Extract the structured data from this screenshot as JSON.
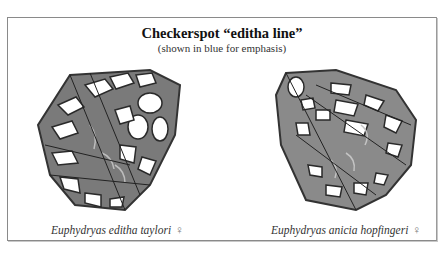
{
  "figure": {
    "title": "Checkerspot “editha line”",
    "subtitle": "(shown in blue for emphasis)",
    "specimens": [
      {
        "name": "Euphydryas editha taylori",
        "sex_symbol": "♀",
        "image": "left-butterfly-wing-illustration"
      },
      {
        "name": "Euphydryas anicia hopfingeri",
        "sex_symbol": "♀",
        "image": "right-butterfly-wing-illustration"
      }
    ]
  },
  "colors": {
    "border": "#8a8a8a",
    "wing_dark": "#3a3a3a",
    "wing_mid": "#7a7a7a",
    "wing_light": "#ffffff",
    "editha_line": "#b8b8b8"
  }
}
